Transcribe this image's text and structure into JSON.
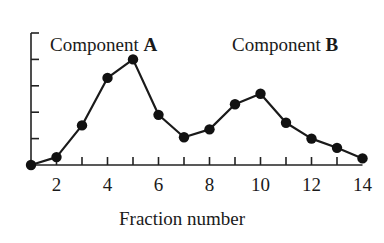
{
  "chart_data": {
    "type": "line",
    "title": "",
    "xlabel": "Fraction number",
    "ylabel": "",
    "x": [
      1,
      2,
      3,
      4,
      5,
      6,
      7,
      8,
      9,
      10,
      11,
      12,
      13,
      14
    ],
    "series": [
      {
        "name": "Elution profile",
        "values": [
          0,
          0.3,
          1.5,
          3.3,
          4.0,
          1.9,
          1.05,
          1.35,
          2.3,
          2.7,
          1.6,
          1.0,
          0.65,
          0.25
        ]
      }
    ],
    "xticks": [
      1,
      2,
      3,
      4,
      5,
      6,
      7,
      8,
      9,
      10,
      11,
      12,
      13,
      14
    ],
    "xtick_labels": [
      "2",
      "4",
      "6",
      "8",
      "10",
      "12",
      "14"
    ],
    "xtick_label_values": [
      2,
      4,
      6,
      8,
      10,
      12,
      14
    ],
    "yticks": [
      0,
      1,
      2,
      3,
      4,
      5
    ],
    "ytick_labels": [],
    "xlim": [
      1,
      14
    ],
    "ylim": [
      0,
      5
    ],
    "grid": false,
    "legend": null,
    "annotations": [
      {
        "text": "Component ",
        "bold": "A",
        "x": 4.5,
        "label": "Component A"
      },
      {
        "text": "Component ",
        "bold": "B",
        "x": 11.5,
        "label": "Component B"
      }
    ],
    "colors": {
      "line": "#1a1a1a",
      "marker": "#111111"
    }
  },
  "labels": {
    "annotation_a_text": "Component ",
    "annotation_a_bold": "A",
    "annotation_b_text": "Component ",
    "annotation_b_bold": "B",
    "xlabel": "Fraction number"
  }
}
